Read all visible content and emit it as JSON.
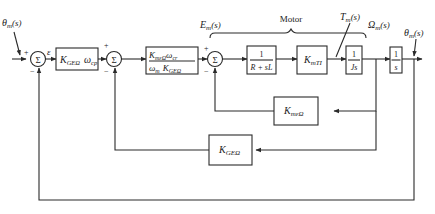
{
  "diagram": {
    "type": "control-system-block-diagram",
    "signals": {
      "input": "θm(s)",
      "error": "ε",
      "armature_voltage": "Em(s)",
      "torque": "Tm(s)",
      "speed": "Ωm(s)",
      "output": "θm(s)"
    },
    "labels": {
      "input_main": "θ",
      "input_sub": "m",
      "input_arg": "(s)",
      "error": "ε",
      "em_main": "E",
      "em_sub": "m",
      "em_arg": "(s)",
      "tm_main": "T",
      "tm_sub": "m",
      "tm_arg": "(s)",
      "omega_main": "Ω",
      "omega_sub": "m",
      "omega_arg": "(s)",
      "out_main": "θ",
      "out_sub": "m",
      "out_arg": "(s)",
      "motor": "Motor",
      "plus": "+",
      "minus": "−",
      "sigma": "Σ"
    },
    "blocks": [
      {
        "id": "kge-omega-cp",
        "main1": "K",
        "sub1": "GEΩ",
        "main2": "ω",
        "sub2": "cp"
      },
      {
        "id": "scaling",
        "num_main1": "K",
        "num_sub1": "mεΩ",
        "num_main2": "ω",
        "num_sub2": "cr",
        "den_main1": "ω",
        "den_sub1": "m",
        "den_main2": "K",
        "den_sub2": "GEΩ"
      },
      {
        "id": "electrical",
        "num": "1",
        "den": "R + sL"
      },
      {
        "id": "torque-constant",
        "main": "K",
        "sub": "mTI"
      },
      {
        "id": "inertia",
        "num": "1",
        "den": "Js"
      },
      {
        "id": "integrator",
        "num": "1",
        "den": "s"
      },
      {
        "id": "back-emf",
        "main": "K",
        "sub": "mεΩ"
      },
      {
        "id": "tach-feedback",
        "main": "K",
        "sub": "GEΩ"
      }
    ],
    "summing_junctions": [
      {
        "id": "sum1",
        "signs": [
          "+",
          "−"
        ]
      },
      {
        "id": "sum2",
        "signs": [
          "+",
          "−"
        ]
      },
      {
        "id": "sum3",
        "signs": [
          "+",
          "−"
        ]
      }
    ]
  }
}
